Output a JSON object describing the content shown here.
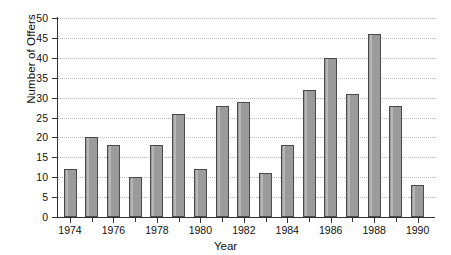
{
  "chart_data": {
    "type": "bar",
    "title": "",
    "xlabel": "Year",
    "ylabel": "Number of Offers",
    "categories": [
      1974,
      1975,
      1976,
      1977,
      1978,
      1979,
      1980,
      1981,
      1982,
      1983,
      1984,
      1985,
      1986,
      1987,
      1988,
      1989,
      1990
    ],
    "values": [
      12,
      20,
      18,
      10,
      18,
      26,
      12,
      28,
      29,
      11,
      18,
      32,
      40,
      31,
      46,
      28,
      8
    ],
    "ylim": [
      0,
      50
    ],
    "ytick_step": 5,
    "ytick_labels": [
      "0",
      "5",
      "10",
      "15",
      "20",
      "25",
      "30",
      "35",
      "40",
      "45",
      "50"
    ],
    "xtick_labels": [
      "1974",
      "1976",
      "1978",
      "1980",
      "1982",
      "1984",
      "1986",
      "1988",
      "1990"
    ],
    "xlim": [
      1973.4,
      1990.8
    ],
    "grid": "horizontal-dotted",
    "legend": "none",
    "bar_color": "#9b9b9b",
    "bar_edge_color": "#4a4a4a",
    "grid_color": "#b8b8b8",
    "axis_color": "#333333",
    "background": "#ffffff"
  }
}
